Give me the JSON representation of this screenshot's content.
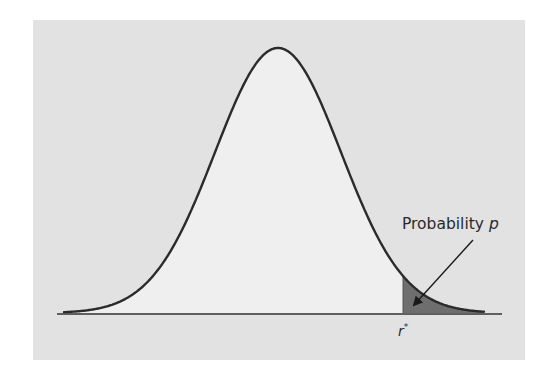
{
  "chart_data": {
    "type": "area",
    "title": "",
    "subtitle": "",
    "xlabel": "",
    "ylabel": "",
    "grid": false,
    "legend": null,
    "distribution": {
      "kind": "normal",
      "mean_px": 278,
      "sd_px": 63
    },
    "shaded_region": {
      "from": "r*",
      "to": "+inf",
      "meaning": "Probability p"
    },
    "x_tick_labels": [
      "r*"
    ],
    "annotations": [
      {
        "text": "Probability p",
        "arrow_to": "shaded right tail"
      }
    ]
  },
  "labels": {
    "probability_prefix": "Probability ",
    "probability_var": "p",
    "critical_value_var": "r",
    "critical_value_sup": "*"
  },
  "colors": {
    "panel_bg": "#e2e2e2",
    "curve_fill": "#efefef",
    "curve_stroke": "#2b2b2b",
    "tail_fill": "#6e6e6e",
    "axis": "#333333"
  }
}
